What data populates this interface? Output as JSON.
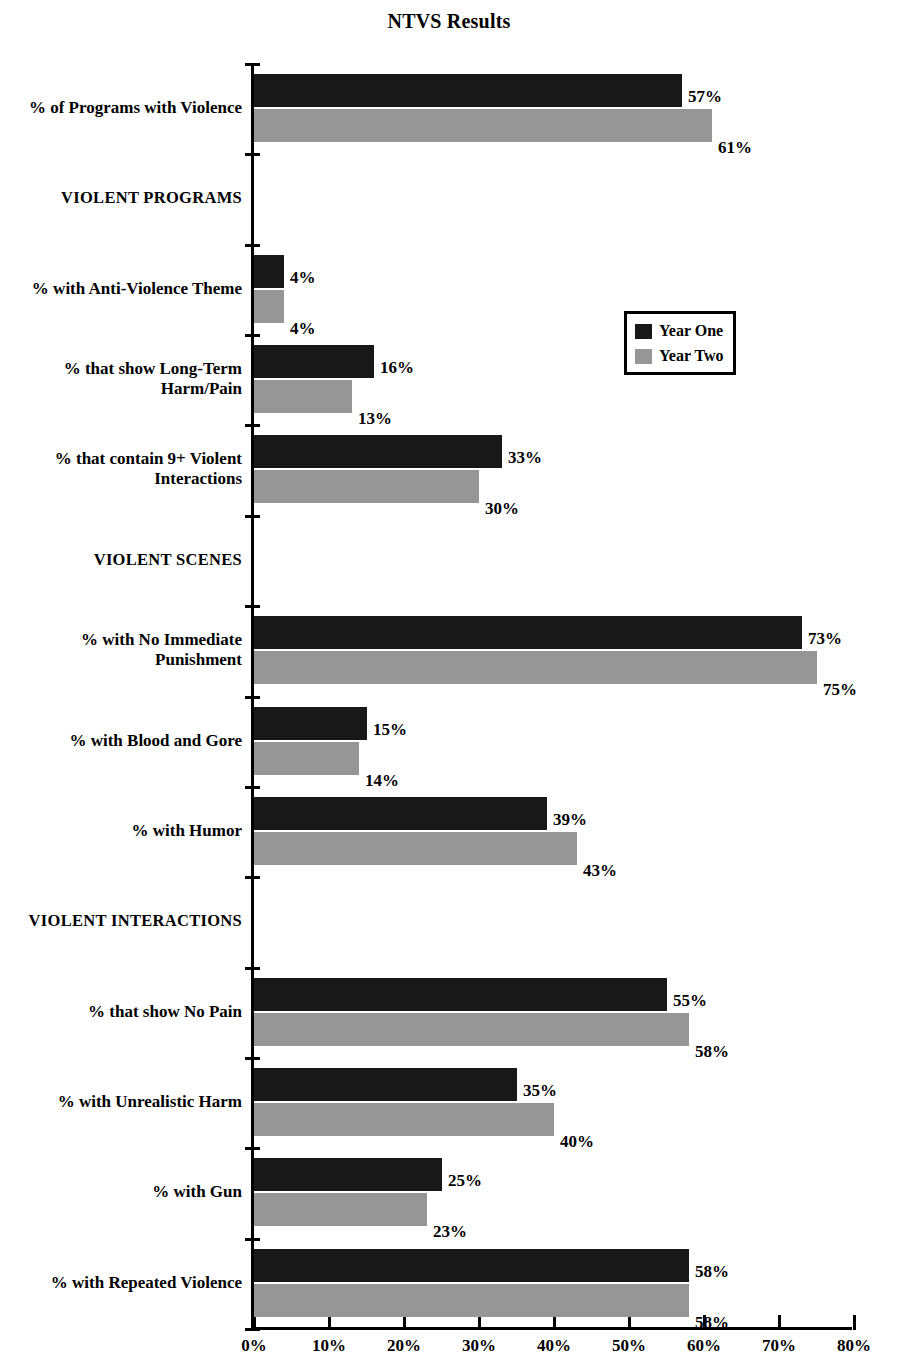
{
  "chart_data": {
    "type": "bar",
    "orientation": "horizontal",
    "title": "NTVS Results",
    "xlabel": "",
    "ylabel": "",
    "xlim": [
      0,
      80
    ],
    "grid": false,
    "legend_position": "middle-right",
    "tick_suffix": "%",
    "xticks": [
      0,
      10,
      20,
      30,
      40,
      50,
      60,
      70,
      80
    ],
    "xtick_labels": [
      "0%",
      "10%",
      "20%",
      "30%",
      "40%",
      "50%",
      "60%",
      "70%",
      "80%"
    ],
    "series": [
      {
        "name": "Year One",
        "color": "#181818"
      },
      {
        "name": "Year Two",
        "color": "#969696"
      }
    ],
    "categories": [
      {
        "label": "% of Programs with Violence",
        "label_lines": [
          "% of Programs with Violence"
        ],
        "is_section": false,
        "year_one": 57,
        "year_two": 61,
        "year_one_label": "57%",
        "year_two_label": "61%"
      },
      {
        "label": "VIOLENT PROGRAMS",
        "label_lines": [
          "VIOLENT PROGRAMS"
        ],
        "is_section": true
      },
      {
        "label": "% with Anti-Violence Theme",
        "label_lines": [
          "% with Anti-Violence Theme"
        ],
        "is_section": false,
        "year_one": 4,
        "year_two": 4,
        "year_one_label": "4%",
        "year_two_label": "4%"
      },
      {
        "label": "% that show Long-Term Harm/Pain",
        "label_lines": [
          "% that show Long-Term",
          "Harm/Pain"
        ],
        "is_section": false,
        "year_one": 16,
        "year_two": 13,
        "year_one_label": "16%",
        "year_two_label": "13%"
      },
      {
        "label": "% that contain 9+ Violent Interactions",
        "label_lines": [
          "% that contain 9+ Violent",
          "Interactions"
        ],
        "is_section": false,
        "year_one": 33,
        "year_two": 30,
        "year_one_label": "33%",
        "year_two_label": "30%"
      },
      {
        "label": "VIOLENT SCENES",
        "label_lines": [
          "VIOLENT SCENES"
        ],
        "is_section": true
      },
      {
        "label": "% with No Immediate Punishment",
        "label_lines": [
          "% with No Immediate",
          "Punishment"
        ],
        "is_section": false,
        "year_one": 73,
        "year_two": 75,
        "year_one_label": "73%",
        "year_two_label": "75%"
      },
      {
        "label": "% with Blood and Gore",
        "label_lines": [
          "% with Blood and Gore"
        ],
        "is_section": false,
        "year_one": 15,
        "year_two": 14,
        "year_one_label": "15%",
        "year_two_label": "14%"
      },
      {
        "label": "% with Humor",
        "label_lines": [
          "% with Humor"
        ],
        "is_section": false,
        "year_one": 39,
        "year_two": 43,
        "year_one_label": "39%",
        "year_two_label": "43%"
      },
      {
        "label": "VIOLENT INTERACTIONS",
        "label_lines": [
          "VIOLENT INTERACTIONS"
        ],
        "is_section": true
      },
      {
        "label": "% that show No Pain",
        "label_lines": [
          "% that show No Pain"
        ],
        "is_section": false,
        "year_one": 55,
        "year_two": 58,
        "year_one_label": "55%",
        "year_two_label": "58%"
      },
      {
        "label": "% with Unrealistic Harm",
        "label_lines": [
          "% with Unrealistic Harm"
        ],
        "is_section": false,
        "year_one": 35,
        "year_two": 40,
        "year_one_label": "35%",
        "year_two_label": "40%"
      },
      {
        "label": "% with Gun",
        "label_lines": [
          "% with Gun"
        ],
        "is_section": false,
        "year_one": 25,
        "year_two": 23,
        "year_one_label": "25%",
        "year_two_label": "23%"
      },
      {
        "label": "% with Repeated Violence",
        "label_lines": [
          "% with Repeated Violence"
        ],
        "is_section": false,
        "year_one": 58,
        "year_two": 58,
        "year_one_label": "58%",
        "year_two_label": "58%"
      }
    ]
  },
  "legend": {
    "items": [
      {
        "label": "Year One",
        "color": "#181818"
      },
      {
        "label": "Year Two",
        "color": "#969696"
      }
    ]
  }
}
